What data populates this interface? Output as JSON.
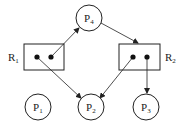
{
  "diagram": {
    "type": "resource-allocation-graph",
    "processes": [
      {
        "id": "P1",
        "label": "P",
        "sub": "1",
        "cx": 38,
        "cy": 107
      },
      {
        "id": "P2",
        "label": "P",
        "sub": "2",
        "cx": 91,
        "cy": 107
      },
      {
        "id": "P3",
        "label": "P",
        "sub": "3",
        "cx": 146,
        "cy": 107
      },
      {
        "id": "P4",
        "label": "P",
        "sub": "4",
        "cx": 89,
        "cy": 18
      }
    ],
    "resources": [
      {
        "id": "R1",
        "label": "R",
        "sub": "1",
        "instances": 2
      },
      {
        "id": "R2",
        "label": "R",
        "sub": "2",
        "instances": 2
      }
    ],
    "edges": [
      {
        "from": "R1.instance2",
        "to": "P4",
        "kind": "assignment"
      },
      {
        "from": "P4",
        "to": "R2",
        "kind": "request"
      },
      {
        "from": "R1.instance1",
        "to": "P2",
        "kind": "assignment"
      },
      {
        "from": "R2.instance1",
        "to": "P2",
        "kind": "assignment"
      },
      {
        "from": "R2.instance2",
        "to": "P3",
        "kind": "assignment"
      }
    ],
    "colors": {
      "stroke": "#222222",
      "background": "#ffffff"
    }
  }
}
